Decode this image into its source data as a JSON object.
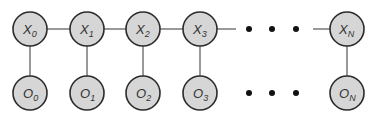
{
  "diagram": {
    "type": "hidden-markov-model",
    "hidden_states": [
      {
        "id": "X0",
        "base": "X",
        "sub": "0",
        "cx": 30,
        "cy": 29
      },
      {
        "id": "X1",
        "base": "X",
        "sub": "1",
        "cx": 87,
        "cy": 29
      },
      {
        "id": "X2",
        "base": "X",
        "sub": "2",
        "cx": 143,
        "cy": 29
      },
      {
        "id": "X3",
        "base": "X",
        "sub": "3",
        "cx": 200,
        "cy": 29
      },
      {
        "id": "XN",
        "base": "X",
        "sub": "N",
        "cx": 347,
        "cy": 29
      }
    ],
    "observations": [
      {
        "id": "O0",
        "base": "O",
        "sub": "0",
        "cx": 30,
        "cy": 93
      },
      {
        "id": "O1",
        "base": "O",
        "sub": "1",
        "cx": 87,
        "cy": 93
      },
      {
        "id": "O2",
        "base": "O",
        "sub": "2",
        "cx": 143,
        "cy": 93
      },
      {
        "id": "O3",
        "base": "O",
        "sub": "3",
        "cx": 200,
        "cy": 93
      },
      {
        "id": "ON",
        "base": "O",
        "sub": "N",
        "cx": 347,
        "cy": 93
      }
    ],
    "ellipsis": {
      "symbol": "• • •",
      "x": [
        249,
        272,
        296
      ],
      "rows_y": [
        29,
        93
      ]
    },
    "node_radius": 17,
    "colors": {
      "node_fill": "#d6d6d6",
      "node_stroke": "#2b2b2b",
      "edge": "#555555",
      "dot": "#111111"
    }
  }
}
